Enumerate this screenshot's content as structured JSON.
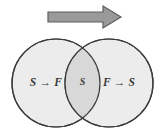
{
  "figure": {
    "background_color": "#ffffff",
    "width": 165,
    "height": 136
  },
  "arrow": {
    "name": "rightward block arrow",
    "direction": "right",
    "fill_color": "#9a9a9a",
    "stroke_color": "#5e5e5e",
    "tail_x": 48,
    "tip_x": 121,
    "center_y": 17,
    "shaft_half_height": 5,
    "head_half_height": 11,
    "head_start_x": 103
  },
  "circles": {
    "fill_color": "#ececec",
    "stroke_color": "#3c3c3c",
    "stroke_width": 1.2,
    "radius": 44,
    "left": {
      "label": "S → F",
      "cx": 56,
      "cy": 83
    },
    "right": {
      "label": "F → S",
      "cx": 109,
      "cy": 83
    }
  },
  "intersection": {
    "label": "S",
    "fill_color": "#d8d8d8",
    "cx": 82.5,
    "cy": 83
  },
  "labels": {
    "left_x": 46,
    "right_x": 119,
    "center_x": 82.5,
    "baseline_y": 83
  }
}
